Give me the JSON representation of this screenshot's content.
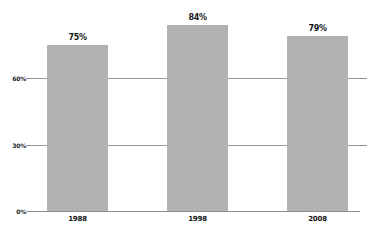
{
  "chart_data": {
    "type": "bar",
    "title": "",
    "subtitle": "",
    "xlabel": "",
    "ylabel": "",
    "categories": [
      "1988",
      "1998",
      "2008"
    ],
    "values": [
      75,
      84,
      79
    ],
    "value_labels": [
      "75%",
      "84%",
      "79%"
    ],
    "series": [
      {
        "name": "",
        "values": [
          75,
          84,
          79
        ]
      }
    ],
    "ylim": [
      0,
      90
    ],
    "y_ticks": [
      0,
      30,
      60
    ],
    "y_tick_labels": [
      "0%",
      "30%",
      "60%"
    ],
    "grid": true,
    "grid_axis": "y",
    "legend": false,
    "legend_position": "none",
    "bar_color": "#b2b2b2",
    "gridline_color": "#9a9a9a",
    "axis_color": "#8e8e8e",
    "label_color": "#141414",
    "background_color": "#ffffff"
  }
}
